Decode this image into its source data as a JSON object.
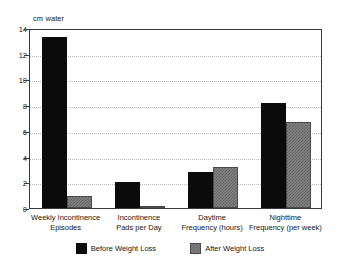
{
  "chart_data": {
    "type": "bar",
    "title": "",
    "subtitle": "",
    "xlabel": "",
    "ylabel": "cm water",
    "ylim": [
      0,
      14
    ],
    "yticks": [
      0,
      2,
      4,
      6,
      8,
      10,
      12,
      14
    ],
    "ytick_labels": [
      "0",
      "2",
      "4",
      "6",
      "8",
      "10",
      "12",
      "14"
    ],
    "grid": true,
    "grid_axis": "y",
    "legend_position": "bottom-center",
    "categories": [
      "Weekly Incontinence\nEpisodes",
      "Incontinence\nPads per Day",
      "Daytime\nFrequency (hours)",
      "Nighttime\nFrequency (per week)"
    ],
    "category_lines": [
      [
        "Weekly Incontinence",
        "Episodes"
      ],
      [
        "Incontinence",
        "Pads per Day"
      ],
      [
        "Daytime",
        "Frequency (hours)"
      ],
      [
        "Nighttime",
        "Frequency (per week)"
      ]
    ],
    "series": [
      {
        "name": "Before Weight Loss",
        "color": "#0b0b0b",
        "values": [
          13.3,
          2.0,
          2.8,
          8.2
        ]
      },
      {
        "name": "After Weight Loss",
        "color": "#848484",
        "values": [
          0.9,
          0.1,
          3.2,
          6.7
        ]
      }
    ]
  },
  "legend": {
    "items": [
      {
        "label": "Before Weight Loss",
        "swatch": "black-solid"
      },
      {
        "label": "After Weight Loss",
        "swatch": "gray-checkered"
      }
    ]
  },
  "axis": {
    "unit_caption": "cm water"
  },
  "colors": {
    "before": "#0b0b0b",
    "after": "#848484",
    "frame": "#3a3a3a",
    "grid": "#b9b9b9",
    "background": "#ffffff"
  }
}
